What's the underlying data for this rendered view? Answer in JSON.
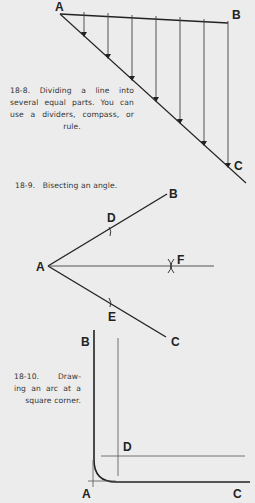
{
  "figures": [
    {
      "id": "18-8",
      "caption_lines": [
        "18-8.  Dividing a line into",
        "several equal parts. You can",
        "use a dividers, compass, or",
        "rule."
      ],
      "caption_full": "18-8. Dividing a line into several equal parts. You can use a dividers, compass, or rule.",
      "labels": {
        "A": "A",
        "B": "B",
        "C": "C"
      },
      "division_count": 7
    },
    {
      "id": "18-9",
      "caption": "18-9.   Bisecting an angle.",
      "labels": {
        "A": "A",
        "B": "B",
        "C": "C",
        "D": "D",
        "E": "E",
        "F": "F"
      }
    },
    {
      "id": "18-10",
      "caption_lines": [
        "18-10.   Draw-",
        "ing an arc at a",
        "square corner."
      ],
      "caption_full": "18-10. Drawing an arc at a square corner.",
      "labels": {
        "A": "A",
        "B": "B",
        "C": "C",
        "D": "D"
      }
    }
  ],
  "colors": {
    "background": "#ececec",
    "ink": "#222222",
    "construction_line": "#555555"
  }
}
